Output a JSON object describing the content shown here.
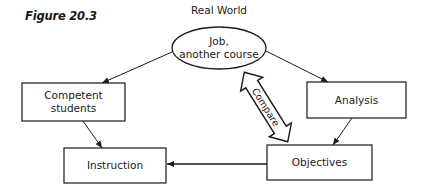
{
  "figure": {
    "label": "Figure 20.3"
  },
  "diagram": {
    "top_label": "Real World",
    "nodes": {
      "real_world": {
        "line1": "Job,",
        "line2": "another course",
        "shape": "ellipse"
      },
      "competent_students": {
        "line1": "Competent",
        "line2": "students",
        "shape": "rectangle"
      },
      "analysis": {
        "label": "Analysis",
        "shape": "rectangle"
      },
      "instruction": {
        "label": "Instruction",
        "shape": "rectangle"
      },
      "objectives": {
        "label": "Objectives",
        "shape": "rectangle"
      }
    },
    "compare_arrow": {
      "label": "Compare",
      "type": "double-headed hollow arrow"
    },
    "edges": [
      {
        "from": "real_world",
        "to": "competent_students"
      },
      {
        "from": "real_world",
        "to": "analysis"
      },
      {
        "from": "competent_students",
        "to": "instruction"
      },
      {
        "from": "analysis",
        "to": "objectives"
      },
      {
        "from": "objectives",
        "to": "instruction"
      },
      {
        "from": "real_world",
        "to": "objectives",
        "label": "Compare",
        "bidirectional": true
      }
    ]
  },
  "colors": {
    "line": "#1a1a1a",
    "background": "#ffffff"
  }
}
